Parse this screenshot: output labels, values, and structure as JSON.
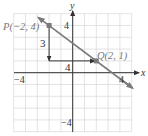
{
  "chart_data": {
    "type": "line",
    "title": "",
    "xlabel": "x",
    "ylabel": "y",
    "xlim": [
      -5,
      5
    ],
    "ylim": [
      -5,
      5
    ],
    "grid": true,
    "x_ticks_labeled": [
      -4,
      4
    ],
    "y_ticks_labeled": [
      -4,
      4
    ],
    "points": [
      {
        "name": "P",
        "x": -2,
        "y": 4,
        "label": "P(−2, 4)"
      },
      {
        "name": "Q",
        "x": 2,
        "y": 1,
        "label": "Q(2, 1)"
      }
    ],
    "line": {
      "through": [
        "P",
        "Q"
      ],
      "slope": -0.75,
      "arrows": "both",
      "x_range": [
        -2.9,
        5
      ]
    },
    "annotations": [
      {
        "type": "rise-arrow",
        "from": [
          -2,
          4
        ],
        "to": [
          -2,
          1
        ],
        "label": "3"
      },
      {
        "type": "run-arrow",
        "from": [
          -2,
          1
        ],
        "to": [
          2,
          1
        ],
        "label": "4"
      }
    ]
  },
  "labels": {
    "x_axis": "x",
    "y_axis": "y",
    "x_neg": "−4",
    "x_pos": "4",
    "y_neg": "−4",
    "y_pos": "4",
    "rise": "3",
    "run": "4",
    "point_p": "P(−2, 4)",
    "point_q": "Q(2, 1)"
  },
  "colors": {
    "grid": "#dcdcdc",
    "axis": "#333333",
    "line": "#7a7a7a",
    "point": "#7a7a7a",
    "text": "#333333",
    "point_text": "#777777"
  }
}
